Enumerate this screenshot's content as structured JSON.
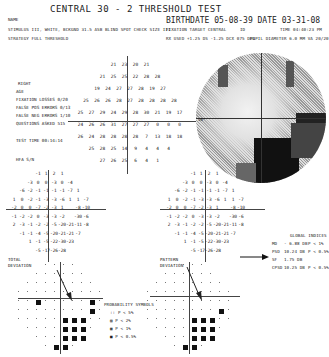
{
  "header": {
    "title": "CENTRAL 30 - 2 THRESHOLD TEST",
    "name_label": "NAME",
    "stimulus": "STIMULUS  III, WHITE, BCKGND 31.5 ASB  BLIND SPOT CHECK SIZE  III",
    "strategy": "STRATEGY  FULL THRESHOLD",
    "birthdate_label": "BIRTHDATE",
    "birthdate": "05-08-39",
    "date_label": "DATE",
    "date": "03-31-08",
    "fixation_target": "FIXATION TARGET  CENTRAL",
    "id": "ID",
    "time": "TIME  04:40:23 PM",
    "rx": "RX USED +1.25 DS -1.25 DCX 075 DEG",
    "pupil": "PUPIL DIAMETER 6.0 MM   VA  20/20"
  },
  "left_panel": {
    "eye": "RIGHT",
    "age": "AGE",
    "fixation_losses": "FIXATION LOSSES  0/20",
    "false_pos": "FALSE POS ERRORS  0/13",
    "false_neg": "FALSE NEG ERRORS  1/10",
    "questions_asked": "QUESTIONS ASKED  515",
    "test_time": "TEST TIME 00:14:14",
    "hfa": "HFA S/N"
  },
  "threshold_grid": {
    "rows": [
      [
        "21",
        "23",
        "20",
        "21"
      ],
      [
        "21",
        "25",
        "25",
        "22",
        "28",
        "28"
      ],
      [
        "19",
        "24",
        "27",
        "27",
        "28",
        "19",
        "27"
      ],
      [
        "25",
        "26",
        "26",
        "28",
        "27",
        "28",
        "28",
        "28",
        "28"
      ],
      [
        "25",
        "27",
        "29",
        "24",
        "29",
        "28",
        "30",
        "21",
        "19",
        "17"
      ],
      [
        "24",
        "26",
        "26",
        "31",
        "27",
        "27",
        "27",
        "0",
        "0",
        "0"
      ],
      [
        "26",
        "24",
        "28",
        "28",
        "28",
        "28",
        "7",
        "13",
        "18",
        "18"
      ],
      [
        "25",
        "28",
        "25",
        "14",
        "9",
        "4",
        "4",
        "4"
      ],
      [
        "27",
        "26",
        "25",
        "6",
        "4",
        "1"
      ]
    ],
    "blind_spot_label": "30°"
  },
  "total_deviation": {
    "label": "TOTAL\nDEVIATION",
    "rows": [
      [
        "-1",
        "1",
        "2",
        "1"
      ],
      [
        "-3",
        "0",
        "0",
        "-3",
        "0",
        "-4"
      ],
      [
        "-6",
        "-2",
        "-1",
        "-1",
        "-1",
        "-1",
        "-7",
        "1"
      ],
      [
        "1",
        "0",
        "-2",
        "-1",
        "-3",
        "-3",
        "-6",
        "1",
        "1",
        "-7"
      ],
      [
        "-2",
        "0",
        "0",
        "-7",
        "-2",
        "-3",
        "1",
        "",
        "-8",
        "-10"
      ],
      [
        "-1",
        "-2",
        "-2",
        "0",
        "-3",
        "-3",
        "-2",
        "",
        "-30",
        "-6"
      ],
      [
        "2",
        "-3",
        "-1",
        "-2",
        "-2",
        "-5",
        "-20",
        "-21",
        "-11",
        "-8"
      ],
      [
        "-1",
        "-1",
        "-4",
        "-5",
        "-20",
        "-21",
        "-21",
        "-7"
      ],
      [
        "1",
        "-1",
        "-5",
        "-22",
        "-30",
        "-23"
      ],
      [
        "-5",
        "-17",
        "-26",
        "-28"
      ]
    ]
  },
  "pattern_deviation": {
    "label": "PATTERN\nDEVIATION",
    "rows": [
      [
        "-1",
        "1",
        "2",
        "1"
      ],
      [
        "-3",
        "0",
        "0",
        "-3",
        "0",
        "-4"
      ],
      [
        "-6",
        "-2",
        "-1",
        "-1",
        "-1",
        "-1",
        "-7",
        "1"
      ],
      [
        "1",
        "0",
        "-2",
        "-1",
        "-3",
        "-3",
        "-6",
        "1",
        "1",
        "-7"
      ],
      [
        "-2",
        "0",
        "0",
        "-7",
        "-2",
        "-3",
        "1",
        "",
        "-8",
        "-10"
      ],
      [
        "-1",
        "-2",
        "-2",
        "0",
        "-3",
        "-3",
        "-2",
        "",
        "-30",
        "-6"
      ],
      [
        "2",
        "-3",
        "-1",
        "-2",
        "-2",
        "-5",
        "-20",
        "-21",
        "-11",
        "-8"
      ],
      [
        "-1",
        "-1",
        "-4",
        "-5",
        "-20",
        "-21",
        "-21",
        "-7"
      ],
      [
        "1",
        "-1",
        "-5",
        "-22",
        "-30",
        "-23"
      ],
      [
        "-5",
        "-17",
        "-26",
        "-28"
      ]
    ]
  },
  "global_indices": {
    "title": "GLOBAL INDICES",
    "items": [
      {
        "key": "MD",
        "value": "- 6.88 DB",
        "p": "P < 1%"
      },
      {
        "key": "PSD",
        "value": "10.24 DB",
        "p": "P < 0.5%"
      },
      {
        "key": "SF",
        "value": "1.75 DB",
        "p": ""
      },
      {
        "key": "CPSD",
        "value": "10.25 DB",
        "p": "P < 0.5%"
      }
    ]
  },
  "probability_legend": {
    "title": "PROBABILITY SYMBOLS",
    "items": [
      {
        "symbol": "::",
        "label": "P < 5%"
      },
      {
        "symbol": "▨",
        "label": "P < 2%"
      },
      {
        "symbol": "▩",
        "label": "P < 1%"
      },
      {
        "symbol": "■",
        "label": "P < 0.5%"
      }
    ]
  }
}
